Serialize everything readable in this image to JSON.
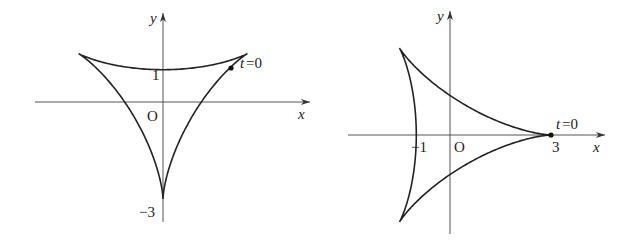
{
  "chart_data": [
    {
      "type": "line",
      "title": "",
      "description": "Parametric closed curve (cardioid-like) with cusp on positive y-axis",
      "xlabel": "x",
      "ylabel": "y",
      "origin_label": "O",
      "tick_labels": {
        "y": [
          "1",
          "-3"
        ]
      },
      "annotations": [
        {
          "text": "t=0",
          "x": 2.1,
          "y": 1.05
        }
      ],
      "cusp": {
        "x": 0,
        "y": 1
      },
      "bottom": {
        "x": 0,
        "y": -3
      },
      "x_intercepts": [
        -2.6,
        2.75
      ]
    },
    {
      "type": "line",
      "title": "",
      "description": "Parametric closed curve (cardioid-like) with cusp on negative x-axis",
      "xlabel": "x",
      "ylabel": "y",
      "origin_label": "O",
      "tick_labels": {
        "x": [
          "-1",
          "3"
        ]
      },
      "annotations": [
        {
          "text": "t=0",
          "x": 3,
          "y": 0
        }
      ],
      "cusp": {
        "x": -1,
        "y": 0
      },
      "rightmost": {
        "x": 3,
        "y": 0
      },
      "y_extent": [
        -2.6,
        2.6
      ]
    }
  ],
  "left": {
    "x_label": "x",
    "y_label": "y",
    "origin": "O",
    "tick_1": "1",
    "tick_neg3": "−3",
    "t0": "t",
    "t0_eq": "=0"
  },
  "right": {
    "x_label": "x",
    "y_label": "y",
    "origin": "O",
    "tick_neg1": "−1",
    "tick_3": "3",
    "t0": "t",
    "t0_eq": "=0"
  }
}
